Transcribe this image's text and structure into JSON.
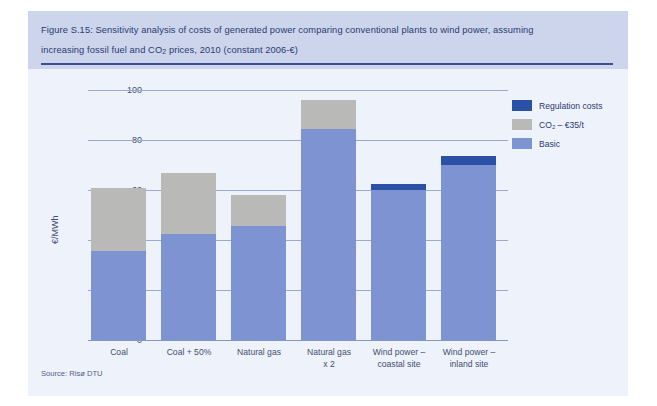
{
  "figure": {
    "caption_line1": "Figure S.15: Sensitivity analysis of costs of generated power comparing conventional plants to wind power, assuming",
    "caption_line2_a": "increasing fossil fuel and CO",
    "caption_line2_sub": "2",
    "caption_line2_b": " prices, 2010 (constant 2006-€)",
    "source": "Source: Risø DTU"
  },
  "legend": {
    "position": "top-right",
    "items": [
      {
        "label": "Regulation costs",
        "color": "#2a51a6",
        "key": "regulation"
      },
      {
        "label": "CO₂ – €35/t",
        "color": "#b9b9b7",
        "key": "co2"
      },
      {
        "label": "Basic",
        "color": "#7e93d1",
        "key": "basic"
      }
    ]
  },
  "chart_data": {
    "type": "bar",
    "stacked": true,
    "title": "Sensitivity analysis of costs of generated power comparing conventional plants to wind power, assuming increasing fossil fuel and CO2 prices, 2010 (constant 2006-€)",
    "xlabel": "",
    "ylabel": "€/MWh",
    "ylim": [
      0,
      100
    ],
    "yticks": [
      0,
      20,
      40,
      60,
      80,
      100
    ],
    "ytick_labels": [
      "0",
      "20",
      "40",
      "60",
      "80",
      "100"
    ],
    "grid": true,
    "grid_axis": "y",
    "categories": [
      "Coal",
      "Coal + 50%",
      "Natural gas",
      "Natural gas\nx 2",
      "Wind power –\ncoastal site",
      "Wind power –\ninland site"
    ],
    "category_labels": [
      {
        "line1": "Coal",
        "line2": ""
      },
      {
        "line1": "Coal + 50%",
        "line2": ""
      },
      {
        "line1": "Natural gas",
        "line2": ""
      },
      {
        "line1": "Natural gas",
        "line2": "x 2"
      },
      {
        "line1": "Wind power –",
        "line2": "coastal site"
      },
      {
        "line1": "Wind power –",
        "line2": "inland site"
      }
    ],
    "series": [
      {
        "name": "Basic",
        "color": "#7e93d1",
        "values": [
          35.5,
          42.5,
          45.5,
          84.5,
          60.0,
          70.0
        ]
      },
      {
        "name": "CO₂ – €35/t",
        "color": "#b9b9b7",
        "values": [
          25.5,
          24.5,
          12.5,
          11.5,
          0,
          0
        ]
      },
      {
        "name": "Regulation costs",
        "color": "#2a51a6",
        "values": [
          0,
          0,
          0,
          0,
          2.5,
          3.5
        ]
      }
    ],
    "totals": [
      61.0,
      67.0,
      58.0,
      96.0,
      62.5,
      73.5
    ]
  }
}
